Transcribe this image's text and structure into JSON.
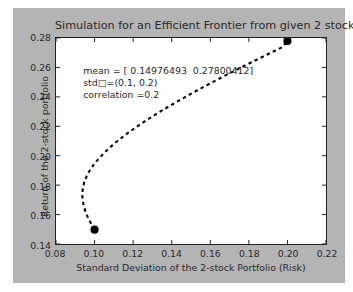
{
  "figure": {
    "background_color": "#b4b4b4",
    "axes_background_color": "#ffffff",
    "page_background_color": "#ffffff"
  },
  "chart_data": {
    "type": "line",
    "title": "Simulation for an Efficient Frontier from given 2 stocks",
    "xlabel": "Standard Deviation of the 2-stock Portfolio (Risk)",
    "ylabel": "Return of the 2-stock portfolio",
    "xlim": [
      0.08,
      0.22
    ],
    "ylim": [
      0.14,
      0.28
    ],
    "xticks": [
      0.08,
      0.1,
      0.12,
      0.14,
      0.16,
      0.18,
      0.2,
      0.22
    ],
    "xticklabels": [
      "0.08",
      "0.10",
      "0.12",
      "0.14",
      "0.16",
      "0.18",
      "0.20",
      "0.22"
    ],
    "yticks": [
      0.14,
      0.16,
      0.18,
      0.2,
      0.22,
      0.24,
      0.26,
      0.28
    ],
    "yticklabels": [
      "0.14",
      "0.16",
      "0.18",
      "0.20",
      "0.22",
      "0.24",
      "0.26",
      "0.28"
    ],
    "grid": false,
    "legend": null,
    "line_style": "dashed",
    "line_color": "#000000",
    "marker_color": "#000000",
    "series": [
      {
        "name": "efficient frontier",
        "x": [
          0.1,
          0.0982,
          0.0966,
          0.0953,
          0.0944,
          0.0938,
          0.0936,
          0.0939,
          0.0946,
          0.0958,
          0.0974,
          0.0995,
          0.102,
          0.1049,
          0.1081,
          0.1117,
          0.1156,
          0.1198,
          0.1242,
          0.1289,
          0.1338,
          0.1389,
          0.1442,
          0.1496,
          0.1552,
          0.1609,
          0.1667,
          0.1727,
          0.1787,
          0.1849,
          0.1911,
          0.1974,
          0.2
        ],
        "y": [
          0.14976493,
          0.1538,
          0.1578,
          0.1618,
          0.1658,
          0.1698,
          0.1738,
          0.1778,
          0.1818,
          0.1858,
          0.1898,
          0.1938,
          0.1978,
          0.2018,
          0.2058,
          0.2098,
          0.2138,
          0.2178,
          0.2218,
          0.2258,
          0.2298,
          0.2338,
          0.2378,
          0.2418,
          0.2458,
          0.2498,
          0.2538,
          0.2578,
          0.2618,
          0.2658,
          0.2698,
          0.2738,
          0.27800412
        ]
      }
    ],
    "markers": [
      {
        "name": "stock-1",
        "x": 0.1,
        "y": 0.14976493
      },
      {
        "name": "stock-2",
        "x": 0.2,
        "y": 0.27800412
      }
    ],
    "annotations": [
      {
        "name": "mean",
        "text": "mean = [ 0.14976493  0.27800412]",
        "x": 0.0945,
        "y": 0.261
      },
      {
        "name": "std",
        "text": "std□=(0.1, 0.2)",
        "x": 0.0945,
        "y": 0.253
      },
      {
        "name": "correlation",
        "text": "correlation =0.2",
        "x": 0.0945,
        "y": 0.245
      }
    ]
  }
}
